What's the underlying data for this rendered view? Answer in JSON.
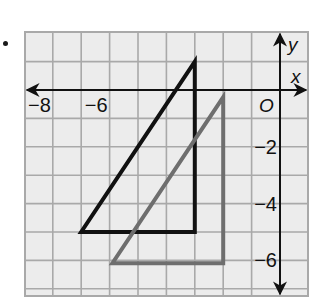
{
  "problem": {
    "marker": "•"
  },
  "graph": {
    "grid": {
      "left_px": 25,
      "top_px": 32,
      "right_px": 308,
      "bottom_px": 296,
      "cell_px": 28.4,
      "background": "#ececec",
      "line_color": "#a9a9a9"
    },
    "origin_px": {
      "x": 280,
      "y": 90
    },
    "axes": {
      "color": "#111111",
      "x_label": "x",
      "y_label": "y",
      "origin_label": "O"
    },
    "x_ticks": [
      {
        "value": -8,
        "label": "−8"
      },
      {
        "value": -6,
        "label": "−6"
      }
    ],
    "y_ticks": [
      {
        "value": -2,
        "label": "−2"
      },
      {
        "value": -4,
        "label": "−4"
      },
      {
        "value": -6,
        "label": "−6"
      }
    ],
    "shapes": [
      {
        "name": "black-triangle",
        "color": "#111111",
        "vertices": [
          [
            -3,
            1
          ],
          [
            -7,
            -5
          ],
          [
            -3,
            -5
          ]
        ]
      },
      {
        "name": "gray-triangle",
        "color": "#6e6e6e",
        "vertices": [
          [
            -2,
            -0.25
          ],
          [
            -5.9,
            -6.1
          ],
          [
            -2,
            -6.1
          ]
        ]
      }
    ]
  },
  "chart_data": {
    "type": "scatter",
    "title": "",
    "xlabel": "x",
    "ylabel": "y",
    "xlim": [
      -9,
      1
    ],
    "ylim": [
      -7.2,
      2
    ],
    "grid": true,
    "x_tick_labels": [
      "−8",
      "−6"
    ],
    "y_tick_labels": [
      "−2",
      "−4",
      "−6"
    ],
    "series": [
      {
        "name": "Black triangle",
        "points": [
          [
            -3,
            1
          ],
          [
            -7,
            -5
          ],
          [
            -3,
            -5
          ]
        ],
        "closed": true
      },
      {
        "name": "Gray triangle",
        "points": [
          [
            -2,
            0
          ],
          [
            -6,
            -6
          ],
          [
            -2,
            -6
          ]
        ],
        "closed": true
      }
    ]
  }
}
